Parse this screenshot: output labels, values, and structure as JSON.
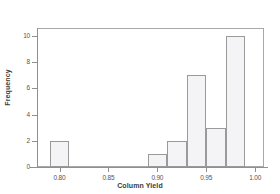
{
  "chart_data": {
    "type": "bar",
    "title": "",
    "xlabel": "Column Yield",
    "ylabel": "Frequency",
    "xlim": [
      0.777,
      1.009
    ],
    "ylim": [
      0,
      10.6
    ],
    "grid": false,
    "legend": null,
    "bin_width": 0.02,
    "x_ticks": [
      "0.80",
      "0.85",
      "0.90",
      "0.95",
      "1.00"
    ],
    "x_tick_values": [
      0.8,
      0.85,
      0.9,
      0.95,
      1.0
    ],
    "y_ticks": [
      "0",
      "2",
      "4",
      "6",
      "8",
      "10"
    ],
    "y_tick_values": [
      0,
      2,
      4,
      6,
      8,
      10
    ],
    "categories": [
      "0.79-0.81",
      "0.89-0.91",
      "0.91-0.93",
      "0.93-0.95",
      "0.95-0.97",
      "0.97-0.99"
    ],
    "values": [
      2,
      1,
      2,
      7,
      3,
      10
    ],
    "bins": [
      {
        "label": "0.79-0.81",
        "start": 0.79,
        "end": 0.81,
        "frequency": 2
      },
      {
        "label": "0.89-0.91",
        "start": 0.89,
        "end": 0.91,
        "frequency": 1
      },
      {
        "label": "0.91-0.93",
        "start": 0.91,
        "end": 0.93,
        "frequency": 2
      },
      {
        "label": "0.93-0.95",
        "start": 0.93,
        "end": 0.95,
        "frequency": 7
      },
      {
        "label": "0.95-0.97",
        "start": 0.95,
        "end": 0.97,
        "frequency": 3
      },
      {
        "label": "0.97-0.99",
        "start": 0.97,
        "end": 0.99,
        "frequency": 10
      }
    ],
    "colors": {
      "bar_fill": "#f4f4f6",
      "bar_border": "#9a9a9a",
      "axis": "#8f8f8f",
      "frame": "#a8a8a8",
      "text": "#4a4a4a",
      "background": "#ffffff"
    }
  }
}
